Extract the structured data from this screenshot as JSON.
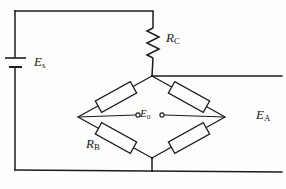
{
  "figure": {
    "kind": "circuit-diagram",
    "stroke_color": "#1c1c1c",
    "background_color": "#fdfdfc",
    "label_color": "#1a1a1a"
  },
  "labels": {
    "source_voltage": {
      "symbol": "E",
      "subscript": "s",
      "name": "E_s"
    },
    "series_resistor": {
      "symbol": "R",
      "subscript": "C",
      "name": "R_C"
    },
    "bridge_resistor": {
      "symbol": "R",
      "subscript": "B",
      "name": "R_B"
    },
    "output_voltage": {
      "symbol": "E",
      "subscript": "o",
      "name": "E_o"
    },
    "excitation_voltage": {
      "symbol": "E",
      "subscript": "A",
      "name": "E_A"
    }
  },
  "components": {
    "battery": {
      "name": "battery-symbol",
      "orientation": "vertical",
      "plates": 2
    },
    "zigzag_resistor": {
      "name": "resistor-rc",
      "style": "zigzag",
      "orientation": "vertical",
      "peaks": 5
    },
    "box_resistors": [
      {
        "name": "resistor-top-left",
        "arm": "top-left"
      },
      {
        "name": "resistor-top-right",
        "arm": "top-right"
      },
      {
        "name": "resistor-bottom-left",
        "arm": "bottom-left"
      },
      {
        "name": "resistor-bottom-right",
        "arm": "bottom-right"
      }
    ],
    "output_terminals": {
      "name": "output-terminals",
      "count": 2,
      "style": "open-circle"
    }
  },
  "nodes": {
    "bridge_top": {
      "x": 152,
      "y": 76
    },
    "bridge_left": {
      "x": 78,
      "y": 117
    },
    "bridge_right": {
      "x": 225,
      "y": 117
    },
    "bridge_bottom": {
      "x": 152,
      "y": 158
    }
  }
}
